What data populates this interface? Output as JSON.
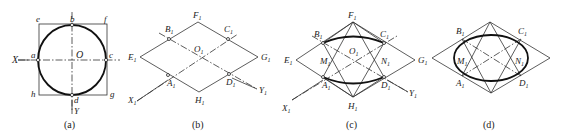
{
  "figure": {
    "panels": [
      {
        "id": "a",
        "caption": "(a)",
        "labels": {
          "e": "e",
          "b": "b",
          "f": "f",
          "X": "X",
          "a": "a",
          "O": "O",
          "c": "c",
          "h": "h",
          "d": "d",
          "g": "g",
          "Y": "Y"
        }
      },
      {
        "id": "b",
        "caption": "(b)",
        "labels": {
          "F": "F",
          "B": "B",
          "C": "C",
          "O": "O",
          "E": "E",
          "G": "G",
          "A": "A",
          "D": "D",
          "H": "H",
          "X": "X",
          "Y": "Y",
          "sub": "1"
        }
      },
      {
        "id": "c",
        "caption": "(c)",
        "labels": {
          "F": "F",
          "B": "B",
          "C": "C",
          "O": "O",
          "E": "E",
          "G": "G",
          "M": "M",
          "N": "N",
          "A": "A",
          "D": "D",
          "H": "H",
          "X": "X",
          "Y": "Y",
          "sub": "1"
        }
      },
      {
        "id": "d",
        "caption": "(d)",
        "labels": {
          "B": "B",
          "C": "C",
          "M": "M",
          "N": "N",
          "A": "A",
          "D": "D",
          "sub": "1"
        }
      }
    ]
  }
}
